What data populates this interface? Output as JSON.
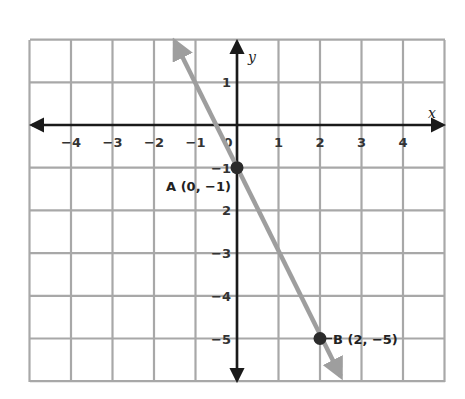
{
  "chart_data": {
    "type": "line",
    "title": "",
    "xlabel": "x",
    "ylabel": "y",
    "xlim": [
      -5,
      5
    ],
    "ylim": [
      -6,
      2
    ],
    "grid": true,
    "x_ticks": [
      -4,
      -3,
      -2,
      -1,
      1,
      2,
      3,
      4
    ],
    "y_ticks": [
      1,
      -1,
      -2,
      -3,
      -4,
      -5
    ],
    "x_tick_labels": [
      "−4",
      "−3",
      "−2",
      "−1",
      "1",
      "2",
      "3",
      "4"
    ],
    "y_tick_labels": [
      "1",
      "−1",
      "2",
      "−3",
      "−4",
      "−5"
    ],
    "origin_label": "0",
    "series": [
      {
        "name": "line through A and B",
        "color": "#9e9e9e",
        "x": [
          -1.5,
          2.5
        ],
        "y": [
          2,
          -6
        ],
        "slope": -2,
        "intercept": -1
      }
    ],
    "points": [
      {
        "name": "A",
        "x": 0,
        "y": -1,
        "label": "A (0, −1)"
      },
      {
        "name": "B",
        "x": 2,
        "y": -5,
        "label": "B (2, −5)"
      }
    ]
  },
  "colors": {
    "grid": "#a8a8a8",
    "axis": "#1a1a1a",
    "line": "#9e9e9e",
    "point": "#2b2b2b"
  }
}
